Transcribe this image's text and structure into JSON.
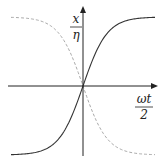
{
  "figure": {
    "y_label_num": "x",
    "y_label_den": "η",
    "x_label_num": "ωt",
    "x_label_den": "2"
  },
  "colors": {
    "axis": "#222222",
    "solid_curve": "#333333",
    "dashed_curve": "#aaaaaa",
    "background": "#ffffff"
  },
  "chart_data": {
    "type": "line",
    "title": "",
    "xlabel": "ωt/2",
    "ylabel": "x/η",
    "grid": false,
    "legend": null,
    "series": [
      {
        "name": "solid",
        "style": "solid",
        "description": "increasing sigmoid (tanh-like), passes through origin",
        "x": [
          -1.0,
          -0.75,
          -0.5,
          -0.25,
          0.0,
          0.25,
          0.5,
          0.75,
          1.0
        ],
        "y": [
          -1.0,
          -0.98,
          -0.85,
          -0.5,
          0.0,
          0.5,
          0.85,
          0.98,
          1.0
        ]
      },
      {
        "name": "dashed",
        "style": "dashed",
        "description": "decreasing sigmoid (mirror image), passes through origin",
        "x": [
          -1.0,
          -0.75,
          -0.5,
          -0.25,
          0.0,
          0.25,
          0.5,
          0.75,
          1.0
        ],
        "y": [
          1.0,
          0.98,
          0.85,
          0.5,
          0.0,
          -0.5,
          -0.85,
          -0.98,
          -1.0
        ]
      }
    ],
    "xlim": [
      -1,
      1
    ],
    "ylim": [
      -1,
      1
    ]
  }
}
